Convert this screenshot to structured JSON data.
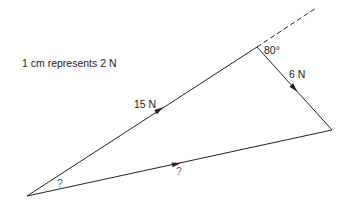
{
  "diagram": {
    "scale_note": "1 cm represents 2 N",
    "forces": [
      {
        "label": "15 N",
        "from": "A",
        "to": "B"
      },
      {
        "label": "6 N",
        "from": "B",
        "to": "C"
      },
      {
        "label": "?",
        "from": "A",
        "to": "C"
      }
    ],
    "angles": [
      {
        "label": "80°",
        "at": "B"
      },
      {
        "label": "?",
        "at": "A"
      }
    ],
    "vertices": {
      "A": [
        27,
        196
      ],
      "B": [
        257,
        47
      ],
      "C": [
        332,
        130
      ]
    },
    "line_color": "#222222"
  }
}
